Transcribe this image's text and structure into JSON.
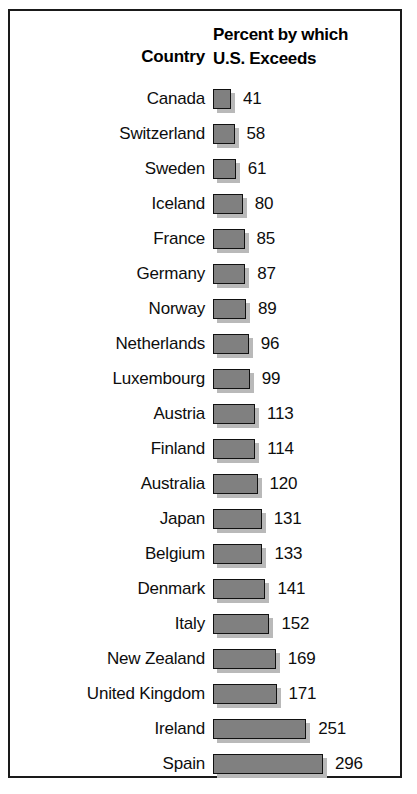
{
  "chart_data": {
    "type": "bar",
    "title": "",
    "xlabel": "",
    "ylabel": "",
    "orientation": "horizontal",
    "grid": false,
    "legend": false,
    "headers": {
      "category": "Country",
      "value_line1": "Percent by which",
      "value_line2": "U.S. Exceeds"
    },
    "axis_range": [
      0,
      296
    ],
    "categories": [
      "Canada",
      "Switzerland",
      "Sweden",
      "Iceland",
      "France",
      "Germany",
      "Norway",
      "Netherlands",
      "Luxembourg",
      "Austria",
      "Finland",
      "Australia",
      "Japan",
      "Belgium",
      "Denmark",
      "Italy",
      "New Zealand",
      "United Kingdom",
      "Ireland",
      "Spain"
    ],
    "values": [
      41,
      58,
      61,
      80,
      85,
      87,
      89,
      96,
      99,
      113,
      114,
      120,
      131,
      133,
      141,
      152,
      169,
      171,
      251,
      296
    ],
    "colors": {
      "bar_fill": "#808080",
      "bar_border": "#111111",
      "bar_shadow": "#b9b9b9",
      "frame": "#1a1a1a",
      "text": "#0d0d0d",
      "background": "#ffffff"
    }
  }
}
